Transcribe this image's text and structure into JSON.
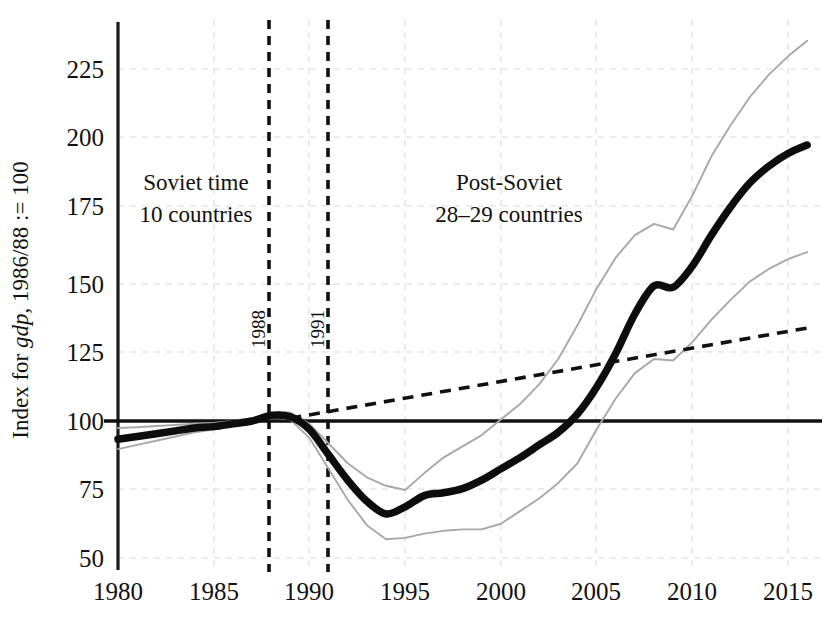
{
  "chart_data": {
    "type": "line",
    "title": "",
    "subtitle": "",
    "xlabel": "",
    "ylabel": "Index for gdp, 1986/88 := 100",
    "ylabel_parts": {
      "pre": "Index for ",
      "italic": "gdp",
      "post": ", 1986/88 := 100"
    },
    "xlim": [
      1980,
      2016
    ],
    "ylim": [
      44,
      240
    ],
    "grid": true,
    "legend_position": "none",
    "xticks": [
      1980,
      1985,
      1990,
      1995,
      2000,
      2005,
      2010,
      2015
    ],
    "yticks": [
      50,
      75,
      100,
      125,
      150,
      175,
      200,
      225
    ],
    "xtick_labels": [
      "1980",
      "1985",
      "1990",
      "1995",
      "2000",
      "2005",
      "2010",
      "2015"
    ],
    "ytick_labels": [
      "50",
      "75",
      "100",
      "125",
      "150",
      "175",
      "200",
      "225"
    ],
    "reference_lines": {
      "horizontal": [
        {
          "value": 100,
          "style": "solid",
          "label": ""
        }
      ],
      "vertical": [
        {
          "value": 1988,
          "style": "dashed",
          "label": "1988"
        },
        {
          "value": 1991,
          "style": "dashed",
          "label": "1991"
        }
      ]
    },
    "annotations": [
      {
        "text_line1": "Soviet time",
        "text_line2": "10 countries",
        "x": 1984.0,
        "y": 182
      },
      {
        "text_line1": "Post-Soviet",
        "text_line2": "28–29 countries",
        "x": 1999.6,
        "y": 182
      }
    ],
    "x": [
      1980,
      1981,
      1982,
      1983,
      1984,
      1985,
      1986,
      1987,
      1988,
      1989,
      1990,
      1991,
      1992,
      1993,
      1994,
      1995,
      1996,
      1997,
      1998,
      1999,
      2000,
      2001,
      2002,
      2003,
      2004,
      2005,
      2006,
      2007,
      2008,
      2009,
      2010,
      2011,
      2012,
      2013,
      2014,
      2015,
      2016
    ],
    "series": [
      {
        "name": "median",
        "style": "thick-black",
        "color": "#0d0d0d",
        "values": [
          93.5,
          94.5,
          95.5,
          96.5,
          97.5,
          98.0,
          99.0,
          100.0,
          102.0,
          101.5,
          97.0,
          88.0,
          79.0,
          71.5,
          67.0,
          69.5,
          73.5,
          74.5,
          76.0,
          79.0,
          83.0,
          87.0,
          91.5,
          96.0,
          102.5,
          112.0,
          124.0,
          138.0,
          148.0,
          147.5,
          155.0,
          166.0,
          176.0,
          184.5,
          190.5,
          195.0,
          198.0
        ]
      },
      {
        "name": "upper-band",
        "style": "thin-gray",
        "color": "#a8a8a8",
        "values": [
          97.5,
          97.8,
          98.2,
          98.6,
          99.0,
          99.3,
          100.0,
          101.0,
          103.0,
          103.0,
          99.0,
          92.0,
          85.0,
          80.0,
          77.0,
          75.5,
          81.5,
          87.0,
          91.0,
          95.0,
          100.5,
          106.0,
          113.0,
          122.0,
          134.0,
          147.0,
          158.0,
          166.0,
          170.0,
          168.0,
          180.0,
          194.0,
          205.0,
          215.0,
          223.0,
          229.5,
          235.0
        ]
      },
      {
        "name": "lower-band",
        "style": "thin-gray",
        "color": "#a8a8a8",
        "values": [
          90.0,
          91.5,
          93.0,
          94.5,
          96.0,
          97.0,
          98.2,
          99.5,
          101.5,
          100.5,
          94.0,
          83.0,
          72.0,
          63.0,
          58.0,
          58.5,
          60.0,
          61.0,
          61.5,
          61.5,
          63.5,
          68.0,
          72.5,
          78.0,
          85.0,
          97.0,
          108.0,
          117.0,
          122.0,
          121.5,
          128.0,
          136.0,
          143.0,
          149.5,
          154.0,
          157.5,
          160.0
        ]
      },
      {
        "name": "counterfactual-trend",
        "style": "dashed-black",
        "color": "#111111",
        "x_start": 1989,
        "x_end": 2016,
        "y_start": 101.0,
        "y_end": 133.0,
        "values": [
          null,
          null,
          null,
          null,
          null,
          null,
          null,
          null,
          null,
          101.0,
          102.2,
          103.4,
          104.6,
          105.8,
          107.0,
          108.2,
          109.4,
          110.6,
          111.8,
          113.0,
          114.2,
          115.4,
          116.6,
          117.8,
          119.0,
          120.2,
          121.4,
          122.6,
          123.8,
          125.0,
          126.2,
          127.4,
          128.6,
          129.8,
          131.0,
          132.0,
          133.0
        ]
      }
    ]
  }
}
